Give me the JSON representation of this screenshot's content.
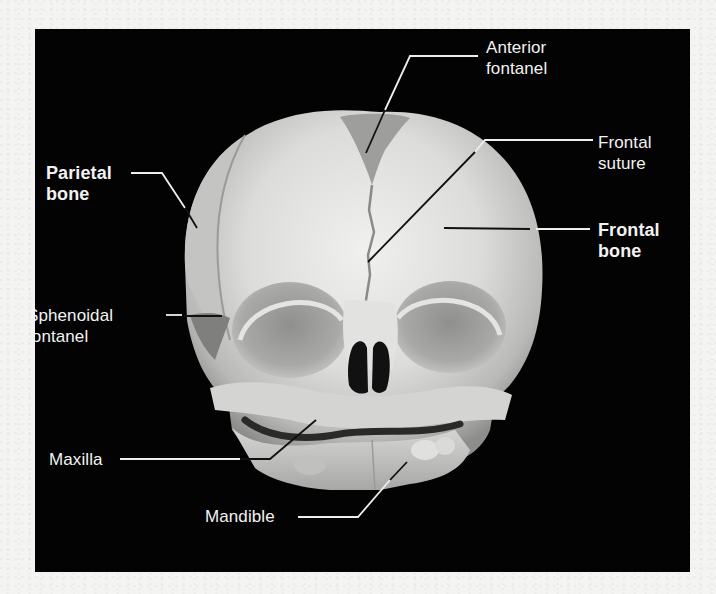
{
  "figure": {
    "colors": {
      "background": "#030303",
      "page": "#f4f4f2",
      "label_text": "#f2f2f2",
      "bone": "#d9d9d9"
    },
    "labels": [
      {
        "id": "anterior-fontanel",
        "text": "Anterior\nfontanel",
        "bold": false
      },
      {
        "id": "frontal-suture",
        "text": "Frontal\nsuture",
        "bold": false
      },
      {
        "id": "parietal-bone",
        "text": "Parietal\nbone",
        "bold": true
      },
      {
        "id": "frontal-bone",
        "text": "Frontal\nbone",
        "bold": true
      },
      {
        "id": "sphenoidal-fontanel",
        "text": "Sphenoidal\nfontanel",
        "bold": false
      },
      {
        "id": "maxilla",
        "text": "Maxilla",
        "bold": false
      },
      {
        "id": "mandible",
        "text": "Mandible",
        "bold": false
      }
    ]
  }
}
